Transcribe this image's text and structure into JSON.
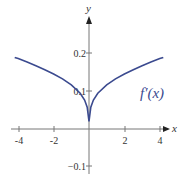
{
  "chart_data": {
    "type": "line",
    "title": "",
    "xlabel": "x",
    "ylabel": "y",
    "xlim": [
      -4.2,
      4.4
    ],
    "ylim": [
      -0.1,
      0.27
    ],
    "x_ticks": [
      -4,
      -2,
      2,
      4
    ],
    "x_tick_labels": [
      "-4",
      "-2",
      "2",
      "4"
    ],
    "y_ticks": [
      0.2,
      0.1,
      -0.1
    ],
    "y_tick_labels": [
      "0.2",
      "0.1",
      "−0.1"
    ],
    "grid": false,
    "series": [
      {
        "name": "f′(x)",
        "color": "#3b4a8f",
        "x": [
          -4.2,
          -4,
          -3.5,
          -3,
          -2.5,
          -2,
          -1.5,
          -1,
          -0.5,
          -0.25,
          -0.1,
          0,
          0.1,
          0.25,
          0.5,
          1,
          1.5,
          2,
          2.5,
          3,
          3.5,
          4,
          4.2
        ],
        "values": [
          0.19,
          0.187,
          0.178,
          0.168,
          0.157,
          0.146,
          0.133,
          0.117,
          0.095,
          0.077,
          0.058,
          0.02,
          0.058,
          0.077,
          0.095,
          0.117,
          0.133,
          0.146,
          0.157,
          0.168,
          0.178,
          0.187,
          0.19
        ]
      }
    ],
    "annotations": [
      {
        "text": "f′(x)",
        "x": 2.9,
        "y": 0.1
      }
    ],
    "legend": "inline label near right branch"
  },
  "axes": {
    "x_label": "x",
    "y_label": "y",
    "x_ticks": [
      "-4",
      "-2",
      "2",
      "4"
    ],
    "y_ticks": [
      "0.2",
      "0.1",
      "−0.1"
    ]
  },
  "series_label": "f′(x)",
  "colors": {
    "curve": "#3b4a8f",
    "axis": "#777777",
    "text": "#333333"
  }
}
